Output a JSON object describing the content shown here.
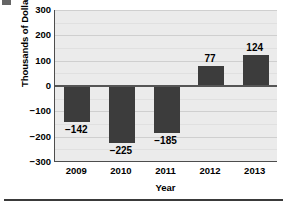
{
  "chart_data": {
    "type": "bar",
    "title": "",
    "categories": [
      "2009",
      "2010",
      "2011",
      "2012",
      "2013"
    ],
    "values": [
      -142,
      -225,
      -185,
      77,
      124
    ],
    "data_labels": [
      "−142",
      "−225",
      "−185",
      "77",
      "124"
    ],
    "xlabel": "Year",
    "ylabel": "Thousands of Dollars",
    "ylim": [
      -300,
      300
    ],
    "ytick_values": [
      300,
      200,
      100,
      0,
      -100,
      -200,
      -300
    ],
    "ytick_labels": [
      "300",
      "200",
      "100",
      "0",
      "−100",
      "−200",
      "−300"
    ],
    "minor_tick_step": 50,
    "grid": true,
    "legend": null,
    "bar_color": "#3c3c3c",
    "plot_background": "#ebebeb",
    "gridline_color": "#d3d3d3",
    "axis_color": "#4d4d4d",
    "zero_line_color": "#555555"
  },
  "figure": {
    "page_background": "#ffffff",
    "bottom_rule_color": "#3a3a3a",
    "corner_artifact_color": "#4a4a4a"
  }
}
